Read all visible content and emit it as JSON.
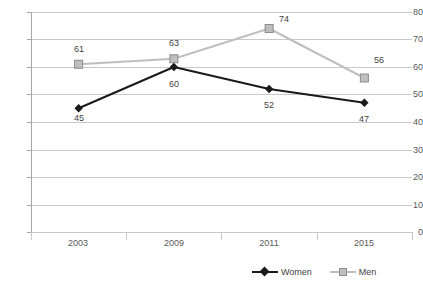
{
  "chart_data": {
    "type": "line",
    "title": "",
    "subtitle": "",
    "xlabel": "",
    "ylabel": "",
    "categories": [
      "2003",
      "2009",
      "2011",
      "2015"
    ],
    "series": [
      {
        "name": "Women",
        "values": [
          45,
          60,
          52,
          47
        ],
        "color": "#1a1a1a",
        "marker": "diamond",
        "label_position": "below"
      },
      {
        "name": "Men",
        "values": [
          61,
          63,
          74,
          56
        ],
        "color": "#bfbfbf",
        "marker": "square",
        "label_position": "above"
      }
    ],
    "ylim": [
      0,
      80
    ],
    "ytick_step": 10,
    "yticks": [
      "80",
      "70",
      "60",
      "50",
      "40",
      "30",
      "20",
      "10",
      "0"
    ],
    "grid": true,
    "grid_axis": "y",
    "legend_position": "bottom-right",
    "data_labels": true,
    "background_color": "#ffffff",
    "gridline_color": "#c9c9c9",
    "axis_color": "#a6a6a6",
    "text_color": "#3f3f3f"
  },
  "legend": {
    "items": [
      {
        "label": "Women"
      },
      {
        "label": "Men"
      }
    ]
  }
}
